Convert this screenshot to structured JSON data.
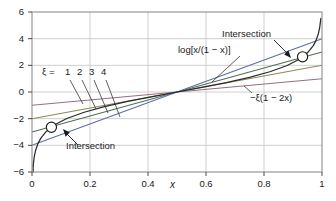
{
  "chart_data": {
    "type": "line",
    "title": "",
    "xlabel": "x",
    "ylabel": "",
    "xlim": [
      0,
      1
    ],
    "ylim": [
      -6,
      6
    ],
    "xticks": [
      "0",
      "0.2",
      "0.4",
      "0.6",
      "0.8",
      "1"
    ],
    "xtickvals": [
      0,
      0.2,
      0.4,
      0.6,
      0.8,
      1
    ],
    "yticks": [
      "6",
      "4",
      "2",
      "0",
      "-2",
      "-4",
      "-6"
    ],
    "ytickvals": [
      6,
      4,
      2,
      0,
      -2,
      -4,
      -6
    ],
    "grid": true,
    "legend": "none",
    "series": [
      {
        "name": "log[x/(1 - x)]",
        "formula": "log[x/(1 - x)]",
        "color": "#2b2b2b",
        "type": "curve",
        "points_x": [
          0.004,
          0.008,
          0.012,
          0.02,
          0.03,
          0.05,
          0.08,
          0.12,
          0.18,
          0.25,
          0.33,
          0.42,
          0.5,
          0.58,
          0.67,
          0.75,
          0.82,
          0.88,
          0.92,
          0.95,
          0.97,
          0.98,
          0.988,
          0.992,
          0.996
        ],
        "points_y": [
          -5.52,
          -4.82,
          -4.41,
          -3.89,
          -3.48,
          -2.94,
          -2.44,
          -1.99,
          -1.52,
          -1.1,
          -0.71,
          -0.32,
          0.0,
          0.32,
          0.71,
          1.1,
          1.52,
          1.99,
          2.44,
          2.94,
          3.48,
          3.89,
          4.41,
          4.82,
          5.52
        ]
      },
      {
        "name": "xi = 1",
        "xi": 1,
        "formula": "-1(1 - 2x)",
        "color": "#9c6b84",
        "type": "line",
        "y_at_x0": -1,
        "y_at_x1": 1
      },
      {
        "name": "xi = 2",
        "xi": 2,
        "formula": "-2(1 - 2x)",
        "color": "#8c8c52",
        "type": "line",
        "y_at_x0": -2,
        "y_at_x1": 2
      },
      {
        "name": "xi = 3",
        "xi": 3,
        "formula": "-3(1 - 2x)",
        "color": "#4f6f53",
        "type": "line",
        "y_at_x0": -3,
        "y_at_x1": 3
      },
      {
        "name": "xi = 4",
        "xi": 4,
        "formula": "-4(1 - 2x)",
        "color": "#5a6fa8",
        "type": "line",
        "y_at_x0": -4,
        "y_at_x1": 4
      }
    ],
    "markers": [
      {
        "name": "intersection-lower",
        "x": 0.067,
        "y": -2.64
      },
      {
        "name": "intersection-upper",
        "x": 0.933,
        "y": 2.64
      }
    ],
    "annotations": {
      "xi_family": "ξ = 1  2  3  4",
      "xi_family_prefix": "ξ =",
      "xi_values": [
        "1",
        "2",
        "3",
        "4"
      ],
      "log_label": "log[x/(1 − x)]",
      "line_label": "−ξ(1 − 2x)",
      "intersection_upper": "Intersection",
      "intersection_lower": "Intersection"
    }
  },
  "axis": {
    "x_name": "x",
    "x_ticks": [
      "0",
      "0.2",
      "0.4",
      "0.6",
      "0.8",
      "1"
    ],
    "y_ticks": [
      "6",
      "4",
      "2",
      "0",
      "−2",
      "−4",
      "−6"
    ]
  },
  "colors": {
    "background": "#ffffff",
    "frame": "#9a9a9a",
    "grid": "#c8c8c8",
    "text": "#1a1a1a",
    "curve_log": "#2b2b2b",
    "xi1": "#9c6b84",
    "xi2": "#8c8c52",
    "xi3": "#4f6f53",
    "xi4": "#5a6fa8"
  }
}
